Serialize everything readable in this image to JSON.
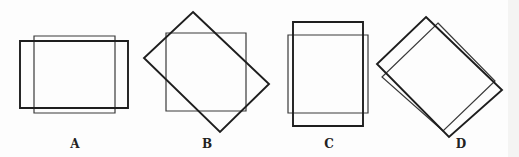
{
  "figure": {
    "panels": [
      {
        "label": "A",
        "label_x": 75,
        "description": "Two overlapping rectangles, one wider, one taller, axis aligned",
        "thick_polygon": "20,41 128,41 128,108 20,108",
        "thin_polygon": "34,36 115,36 115,113 34,113"
      },
      {
        "label": "B",
        "label_x": 207,
        "description": "Axis-aligned square overlapped by a rotated rectangle",
        "thick_polygon": "193,12 269,84 220,132 144,58",
        "thin_polygon": "166,33 246,33 246,111 166,111"
      },
      {
        "label": "C",
        "label_x": 329,
        "description": "Two overlapping upright rectangles, one taller, one wider",
        "thick_polygon": "293,22 363,22 363,126 293,126",
        "thin_polygon": "288,35 368,35 368,113 288,113"
      },
      {
        "label": "D",
        "label_x": 461,
        "description": "Two overlapping rectangles both rotated about 45 degrees",
        "thick_polygon": "426,17 502,90 449,137 377,64",
        "thin_polygon": "438,23 495,81 443,131 382,77"
      }
    ],
    "colors": {
      "thick_stroke": "#1e1e1e",
      "thin_stroke": "#3a3a3a"
    }
  }
}
